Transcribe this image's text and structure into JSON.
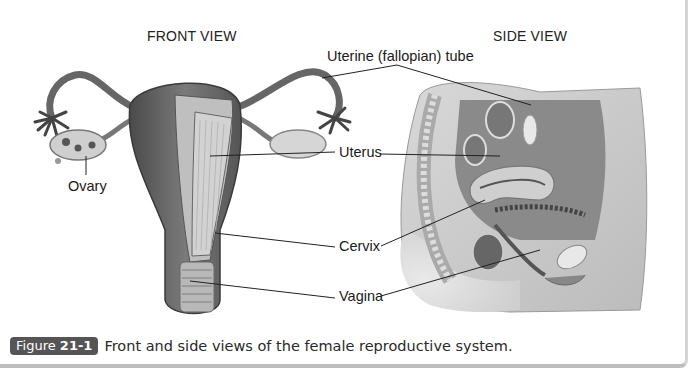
{
  "figure": {
    "views": {
      "front": "FRONT VIEW",
      "side": "SIDE VIEW"
    },
    "labels": {
      "tube": "Uterine (fallopian) tube",
      "ovary": "Ovary",
      "uterus": "Uterus",
      "cervix": "Cervix",
      "vagina": "Vagina"
    },
    "caption": {
      "badge_prefix": "Figure",
      "badge_number": "21-1",
      "text": "Front and side views of the female reproductive system."
    },
    "colors": {
      "badge_bg": "#555555",
      "leader_line": "#222222",
      "tissue_dark": "#5a5a5a",
      "tissue_light": "#c8c8c8"
    }
  }
}
